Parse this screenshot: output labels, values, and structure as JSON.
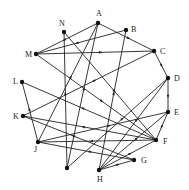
{
  "diagram": {
    "type": "directed-graph",
    "nodes": [
      {
        "id": "A",
        "label": "A",
        "x": 98,
        "y": 23,
        "lx": 96,
        "ly": 16
      },
      {
        "id": "B",
        "label": "B",
        "x": 126,
        "y": 30,
        "lx": 131,
        "ly": 32
      },
      {
        "id": "C",
        "label": "C",
        "x": 154,
        "y": 51,
        "lx": 160,
        "ly": 54
      },
      {
        "id": "D",
        "label": "D",
        "x": 168,
        "y": 78,
        "lx": 174,
        "ly": 81
      },
      {
        "id": "E",
        "label": "E",
        "x": 168,
        "y": 112,
        "lx": 174,
        "ly": 115
      },
      {
        "id": "F",
        "label": "F",
        "x": 156,
        "y": 140,
        "lx": 163,
        "ly": 144
      },
      {
        "id": "G",
        "label": "G",
        "x": 134,
        "y": 160,
        "lx": 141,
        "ly": 163
      },
      {
        "id": "H",
        "label": "H",
        "x": 99,
        "y": 170,
        "lx": 97,
        "ly": 182
      },
      {
        "id": "I",
        "label": "",
        "x": 67,
        "y": 168,
        "lx": 0,
        "ly": 0
      },
      {
        "id": "J",
        "label": "J",
        "x": 38,
        "y": 142,
        "lx": 34,
        "ly": 152
      },
      {
        "id": "K",
        "label": "K",
        "x": 23,
        "y": 116,
        "lx": 13,
        "ly": 119
      },
      {
        "id": "L",
        "label": "L",
        "x": 22,
        "y": 82,
        "lx": 13,
        "ly": 84
      },
      {
        "id": "M",
        "label": "M",
        "x": 36,
        "y": 54,
        "lx": 25,
        "ly": 57
      },
      {
        "id": "N",
        "label": "N",
        "x": 64,
        "y": 32,
        "lx": 59,
        "ly": 26
      }
    ],
    "edges": [
      {
        "from": "A",
        "to": "M"
      },
      {
        "from": "B",
        "to": "M"
      },
      {
        "from": "M",
        "to": "C"
      },
      {
        "from": "M",
        "to": "F"
      },
      {
        "from": "A",
        "to": "C"
      },
      {
        "from": "N",
        "to": "F"
      },
      {
        "from": "I",
        "to": "N"
      },
      {
        "from": "J",
        "to": "A"
      },
      {
        "from": "I",
        "to": "A"
      },
      {
        "from": "H",
        "to": "B"
      },
      {
        "from": "C",
        "to": "D"
      },
      {
        "from": "K",
        "to": "C"
      },
      {
        "from": "D",
        "to": "E"
      },
      {
        "from": "I",
        "to": "D"
      },
      {
        "from": "H",
        "to": "D"
      },
      {
        "from": "E",
        "to": "F"
      },
      {
        "from": "J",
        "to": "E"
      },
      {
        "from": "F",
        "to": "L"
      },
      {
        "from": "J",
        "to": "L"
      },
      {
        "from": "G",
        "to": "K"
      },
      {
        "from": "F",
        "to": "K"
      },
      {
        "from": "J",
        "to": "G"
      },
      {
        "from": "F",
        "to": "J"
      },
      {
        "from": "H",
        "to": "G"
      },
      {
        "from": "H",
        "to": "F"
      },
      {
        "from": "H",
        "to": "E"
      }
    ]
  }
}
